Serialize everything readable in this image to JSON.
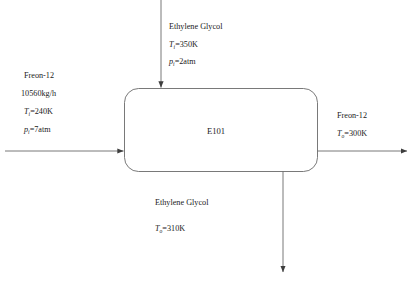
{
  "diagram": {
    "type": "process-flow-diagram",
    "stroke_color": "#4a4a4a",
    "background_color": "#ffffff",
    "unit": {
      "tag": "E101",
      "shape": "rounded-rectangle"
    },
    "streams": {
      "hot_inlet": {
        "name": "Ethylene Glycol",
        "direction": "top-inlet",
        "temperature": {
          "symbol": "T",
          "subscript": "i",
          "value": "350K",
          "text": "=350K"
        },
        "pressure": {
          "symbol": "p",
          "subscript": "i",
          "value": "2atm",
          "text": "=2atm"
        }
      },
      "cold_inlet": {
        "name": "Freon-12",
        "direction": "left-inlet",
        "flow_rate": "10560kg/h",
        "temperature": {
          "symbol": "T",
          "subscript": "i",
          "value": "240K",
          "text": "=240K"
        },
        "pressure": {
          "symbol": "p",
          "subscript": "i",
          "value": "7atm",
          "text": "=7atm"
        }
      },
      "cold_outlet": {
        "name": "Freon-12",
        "direction": "right-outlet",
        "temperature": {
          "symbol": "T",
          "subscript": "o",
          "value": "300K",
          "text": "=300K"
        }
      },
      "hot_outlet": {
        "name": "Ethylene Glycol",
        "direction": "bottom-outlet",
        "temperature": {
          "symbol": "T",
          "subscript": "o",
          "value": "310K",
          "text": "=310K"
        }
      }
    }
  }
}
